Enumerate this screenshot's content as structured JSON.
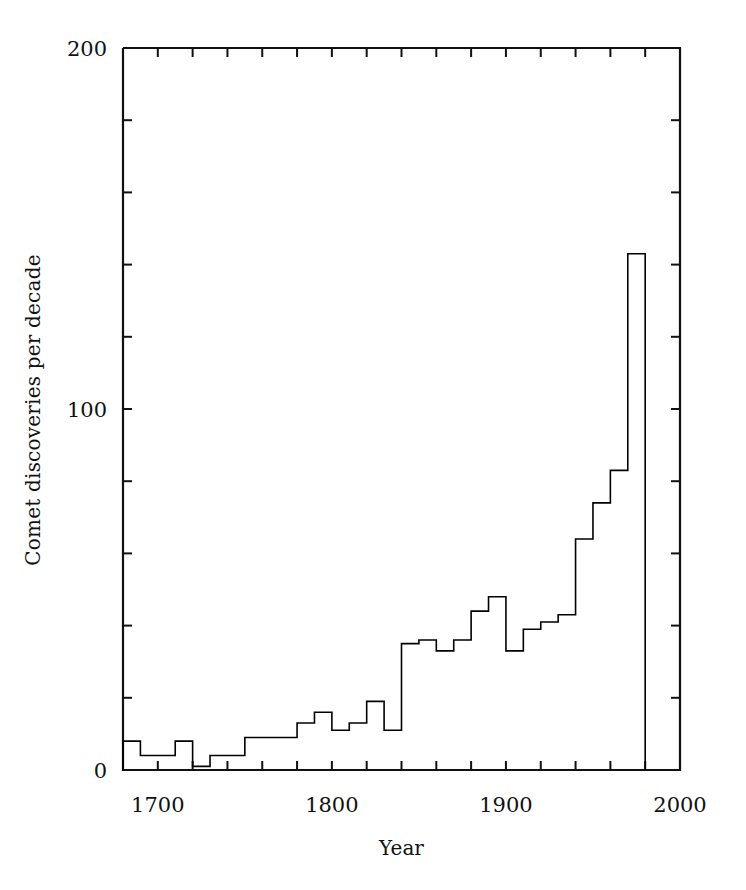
{
  "chart_data": {
    "type": "line",
    "subtype": "step-histogram",
    "title": "",
    "xlabel": "Year",
    "ylabel": "Comet discoveries per decade",
    "xlim": [
      1680,
      2000
    ],
    "ylim": [
      0,
      200
    ],
    "grid": false,
    "legend": null,
    "x_ticklabels": [
      "1700",
      "1800",
      "1900",
      "2000"
    ],
    "x_ticklabel_values": [
      1700,
      1800,
      1900,
      2000
    ],
    "x_minor_tick_step": 20,
    "y_ticklabels": [
      "0",
      "100",
      "200"
    ],
    "y_ticklabel_values": [
      0,
      100,
      200
    ],
    "y_minor_tick_step": 20,
    "bin_width": 10,
    "categories": [
      "1680",
      "1690",
      "1700",
      "1710",
      "1720",
      "1730",
      "1740",
      "1750",
      "1760",
      "1770",
      "1780",
      "1790",
      "1800",
      "1810",
      "1820",
      "1830",
      "1840",
      "1850",
      "1860",
      "1870",
      "1880",
      "1890",
      "1900",
      "1910",
      "1920",
      "1930",
      "1940",
      "1950",
      "1960",
      "1970"
    ],
    "values": [
      8,
      4,
      4,
      8,
      1,
      4,
      4,
      9,
      9,
      9,
      13,
      16,
      11,
      13,
      19,
      11,
      35,
      36,
      33,
      36,
      44,
      48,
      33,
      39,
      41,
      43,
      64,
      74,
      83,
      143
    ],
    "series": [
      {
        "name": "Comet discoveries per decade",
        "values": [
          8,
          4,
          4,
          8,
          1,
          4,
          4,
          9,
          9,
          9,
          13,
          16,
          11,
          13,
          19,
          11,
          35,
          36,
          33,
          36,
          44,
          48,
          33,
          39,
          41,
          43,
          64,
          74,
          83,
          143
        ]
      }
    ],
    "line_color": "#000000",
    "line_width": 1.6,
    "background_color": "#ffffff"
  },
  "axes": {
    "y_label_text": "Comet discoveries per decade",
    "x_label_text": "Year"
  }
}
